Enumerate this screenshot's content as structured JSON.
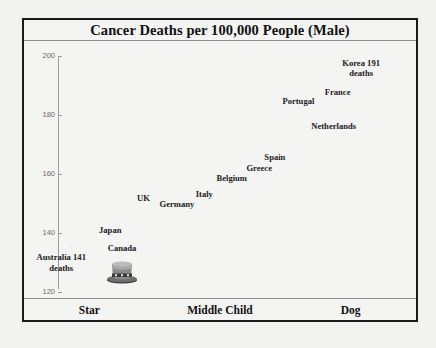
{
  "chart_data": {
    "type": "scatter",
    "title": "Cancer Deaths per 100,000 People (Male)",
    "xlabel": "",
    "ylabel": "",
    "ylim": [
      120,
      200
    ],
    "yticks": [
      200,
      180,
      160,
      140,
      120
    ],
    "grid": false,
    "legend": false,
    "x_categories": [
      "Star",
      "Middle Child",
      "Dog"
    ],
    "points": [
      {
        "label": "Korea 191 deaths",
        "name": "Korea",
        "value": 191,
        "x_pct": 86,
        "y_pct": 10.5,
        "note": "191 deaths"
      },
      {
        "label": "France",
        "name": "France",
        "value": 184,
        "x_pct": 80,
        "y_pct": 20.0
      },
      {
        "label": "Portugal",
        "name": "Portugal",
        "value": 182,
        "x_pct": 70,
        "y_pct": 23.5
      },
      {
        "label": "Netherlands",
        "name": "Netherlands",
        "value": 176,
        "x_pct": 79,
        "y_pct": 33.0
      },
      {
        "label": "Spain",
        "name": "Spain",
        "value": 166,
        "x_pct": 64,
        "y_pct": 45.0
      },
      {
        "label": "Greece",
        "name": "Greece",
        "value": 163,
        "x_pct": 60,
        "y_pct": 49.5
      },
      {
        "label": "Belgium",
        "name": "Belgium",
        "value": 161,
        "x_pct": 53,
        "y_pct": 53.5
      },
      {
        "label": "Italy",
        "name": "Italy",
        "value": 157,
        "x_pct": 46,
        "y_pct": 59.5
      },
      {
        "label": "Germany",
        "name": "Germany",
        "value": 155,
        "x_pct": 39,
        "y_pct": 63.5
      },
      {
        "label": "UK",
        "name": "UK",
        "value": 156,
        "x_pct": 31,
        "y_pct": 61.0
      },
      {
        "label": "Japan",
        "name": "Japan",
        "value": 149,
        "x_pct": 22,
        "y_pct": 73.5
      },
      {
        "label": "Canada",
        "name": "Canada",
        "value": 145,
        "x_pct": 25,
        "y_pct": 80.5
      },
      {
        "label": "Australia 141 deaths",
        "name": "Australia",
        "value": 141,
        "x_pct": 9,
        "y_pct": 86.0,
        "note": "141 deaths"
      }
    ],
    "marker": {
      "type": "top-hat",
      "x_pct": 25,
      "y_pct": 89.0
    }
  },
  "chart": {
    "title": "Cancer Deaths per 100,000 People (Male)",
    "y_tick_labels": [
      "200",
      "180",
      "160",
      "140",
      "120"
    ],
    "x_categories": [
      "Star",
      "Middle Child",
      "Dog"
    ],
    "labels": [
      "Korea 191\ndeaths",
      "France",
      "Portugal",
      "Netherlands",
      "Spain",
      "Greece",
      "Belgium",
      "Italy",
      "Germany",
      "UK",
      "Japan",
      "Canada",
      "Australia 141\ndeaths"
    ]
  },
  "colors": {
    "page_background": "#f2f2f0",
    "chart_background": "#f4f4f2",
    "frame_border": "#1a1a1a",
    "axis_line": "#9a9a9a",
    "tick_label": "#6b6b6b",
    "text": "#1a1a1a"
  }
}
